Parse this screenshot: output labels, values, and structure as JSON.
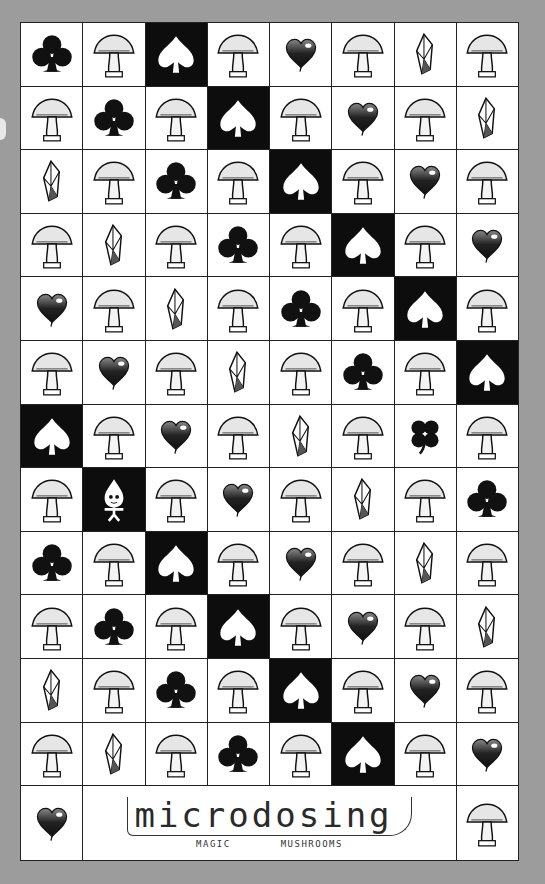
{
  "title": {
    "logo_text": "microdosing",
    "subtitle_left": "MAGIC",
    "subtitle_right": "MUSHROOMS"
  },
  "colors": {
    "background": "#9c9c9c",
    "paper": "#fdfdfd",
    "ink": "#111111",
    "dark_cell": "#0d0d0d"
  },
  "grid": {
    "columns": 8,
    "rows": 13,
    "legend": {
      "S": "spade on black",
      "C": "club",
      "H": "heart",
      "X": "crystal",
      "L": "four-leaf clover",
      "P": "mushroom spirit on black",
      "M": "mushroom"
    },
    "cells": [
      [
        "C",
        "M",
        "S",
        "M",
        "H",
        "M",
        "X",
        "M"
      ],
      [
        "M",
        "C",
        "M",
        "S",
        "M",
        "H",
        "M",
        "X"
      ],
      [
        "X",
        "M",
        "C",
        "M",
        "S",
        "M",
        "H",
        "M"
      ],
      [
        "M",
        "X",
        "M",
        "C",
        "M",
        "S",
        "M",
        "H"
      ],
      [
        "H",
        "M",
        "X",
        "M",
        "C",
        "M",
        "S",
        "M"
      ],
      [
        "M",
        "H",
        "M",
        "X",
        "M",
        "C",
        "M",
        "S"
      ],
      [
        "S",
        "M",
        "H",
        "M",
        "X",
        "M",
        "L",
        "M"
      ],
      [
        "M",
        "P",
        "M",
        "H",
        "M",
        "X",
        "M",
        "C"
      ],
      [
        "C",
        "M",
        "S",
        "M",
        "H",
        "M",
        "X",
        "M"
      ],
      [
        "M",
        "C",
        "M",
        "S",
        "M",
        "H",
        "M",
        "X"
      ],
      [
        "X",
        "M",
        "C",
        "M",
        "S",
        "M",
        "H",
        "M"
      ],
      [
        "M",
        "X",
        "M",
        "C",
        "M",
        "S",
        "M",
        "H"
      ],
      [
        "H",
        "TITLE",
        "M"
      ]
    ]
  }
}
